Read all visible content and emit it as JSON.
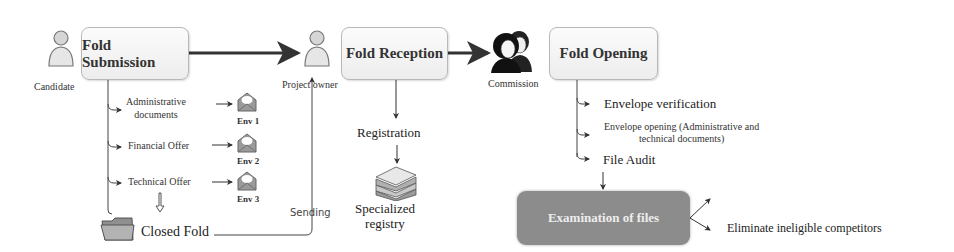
{
  "actors": {
    "candidate": {
      "label": "Candidate",
      "icon": "person-icon"
    },
    "project_owner": {
      "label": "Project owner",
      "icon": "person-icon"
    },
    "commission": {
      "label": "Commission",
      "icon": "group-icon"
    }
  },
  "stages": {
    "submission": {
      "label": "Fold Submission"
    },
    "reception": {
      "label": "Fold Reception"
    },
    "opening": {
      "label": "Fold Opening"
    }
  },
  "submission_items": [
    {
      "label_line1": "Administrative",
      "label_line2": "documents",
      "envelope": "Env 1"
    },
    {
      "label": "Financial Offer",
      "envelope": "Env 2"
    },
    {
      "label": "Technical Offer",
      "envelope": "Env 3"
    }
  ],
  "closed_fold": {
    "label": "Closed Fold",
    "icon": "folder-icon"
  },
  "sending": {
    "label": "Sending"
  },
  "reception_items": {
    "registration": "Registration",
    "registry_line1": "Specialized",
    "registry_line2": "registry",
    "registry_icon": "document-stack-icon"
  },
  "opening_items": [
    {
      "label": "Envelope verification"
    },
    {
      "label_line1": "Envelope opening (Administrative and",
      "label_line2": "technical documents)"
    },
    {
      "label": "File Audit"
    }
  ],
  "examination": {
    "label": "Examination of files"
  },
  "outcomes": [
    {
      "label": ""
    },
    {
      "label": "Eliminate ineligible competitors"
    }
  ],
  "colors": {
    "stage_border": "#b8b8b8",
    "stage_fill": "#efefef",
    "exam_fill": "#8c8c8c",
    "line": "#333333"
  }
}
